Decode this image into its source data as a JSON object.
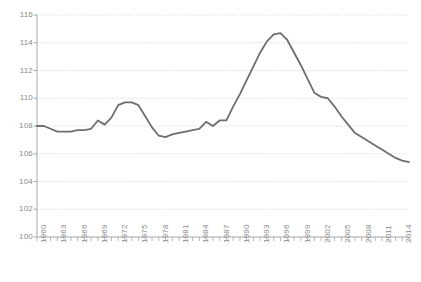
{
  "chart_data": {
    "type": "line",
    "title": "",
    "subtitle": "",
    "xlabel": "",
    "ylabel": "",
    "xlim": [
      1960,
      2015
    ],
    "ylim": [
      100,
      116
    ],
    "ytick_step": 2,
    "xtick_step": 3,
    "grid": true,
    "grid_style": "dotted-horizontal",
    "legend": "none",
    "line_color": "#6e6e6e",
    "axis_color": "#a6a6a6",
    "label_color": "#8a8a8a",
    "ytick_labels": [
      "116",
      "114",
      "112",
      "110",
      "108",
      "106",
      "104",
      "102",
      "100"
    ],
    "ytick_values": [
      116,
      114,
      112,
      110,
      108,
      106,
      104,
      102,
      100
    ],
    "xtick_labels": [
      "1960",
      "1963",
      "1966",
      "1969",
      "1972",
      "1975",
      "1978",
      "1981",
      "1984",
      "1987",
      "1990",
      "1993",
      "1996",
      "1999",
      "2002",
      "2005",
      "2008",
      "2011",
      "2014"
    ],
    "xtick_values": [
      1960,
      1963,
      1966,
      1969,
      1972,
      1975,
      1978,
      1981,
      1984,
      1987,
      1990,
      1993,
      1996,
      1999,
      2002,
      2005,
      2008,
      2011,
      2014
    ],
    "minor_ticks_every": 1,
    "series": [
      {
        "name": "value",
        "x": [
          1960,
          1961,
          1962,
          1963,
          1964,
          1965,
          1966,
          1967,
          1968,
          1969,
          1970,
          1971,
          1972,
          1973,
          1974,
          1975,
          1976,
          1977,
          1978,
          1979,
          1980,
          1981,
          1982,
          1983,
          1984,
          1985,
          1986,
          1987,
          1988,
          1989,
          1990,
          1991,
          1992,
          1993,
          1994,
          1995,
          1996,
          1997,
          1998,
          1999,
          2000,
          2001,
          2002,
          2003,
          2004,
          2005,
          2006,
          2007,
          2008,
          2009,
          2010,
          2011,
          2012,
          2013,
          2014,
          2015
        ],
        "values": [
          108.0,
          108.0,
          107.8,
          107.6,
          107.6,
          107.6,
          107.7,
          107.7,
          107.8,
          108.4,
          108.1,
          108.6,
          109.5,
          109.7,
          109.7,
          109.5,
          108.7,
          107.9,
          107.3,
          107.2,
          107.4,
          107.5,
          107.6,
          107.7,
          107.8,
          108.3,
          108.0,
          108.4,
          108.4,
          109.4,
          110.3,
          111.3,
          112.3,
          113.3,
          114.1,
          114.6,
          114.7,
          114.2,
          113.3,
          112.4,
          111.4,
          110.4,
          110.1,
          110.0,
          109.4,
          108.7,
          108.1,
          107.5,
          107.2,
          106.9,
          106.6,
          106.3,
          106.0,
          105.7,
          105.5,
          105.4
        ]
      }
    ]
  }
}
